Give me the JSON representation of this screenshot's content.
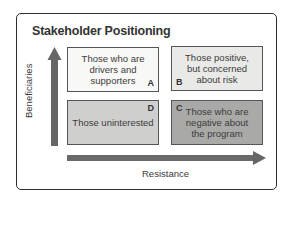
{
  "title": "Stakeholder Positioning",
  "axes": {
    "y_label": "Beneficiaries",
    "x_label": "Resistance"
  },
  "quadrants": {
    "A": {
      "letter": "A",
      "text": "Those who are drivers and supporters",
      "lines": [
        "Those who are",
        "drivers and",
        "supporters"
      ],
      "fill": "#f8f8f6"
    },
    "B": {
      "letter": "B",
      "text": "Those positive, but concerned about risk",
      "lines": [
        "Those positive,",
        "but concerned",
        "about risk"
      ],
      "fill": "#e9e9e7"
    },
    "C": {
      "letter": "C",
      "text": "Those who are negative about the program",
      "lines": [
        "Those who are",
        "negative about",
        "the program"
      ],
      "fill": "#a9a9a7"
    },
    "D": {
      "letter": "D",
      "text": "Those uninterested",
      "lines": [
        "Those uninterested"
      ],
      "fill": "#cfcfcd"
    }
  },
  "colors": {
    "arrow": "#666666",
    "border": "#2e2e2e"
  }
}
